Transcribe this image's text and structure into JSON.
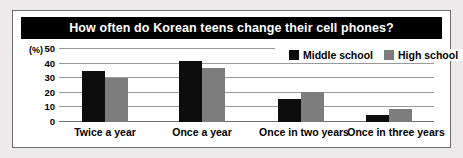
{
  "title": "How often do Korean teens change their cell phones?",
  "y_unit": "(%)",
  "legend": {
    "items": [
      {
        "label": "Middle school",
        "color": "#0d0d0d",
        "swatch": "black-square-icon"
      },
      {
        "label": "High school",
        "color": "#7d7d7d",
        "swatch": "gray-square-icon"
      }
    ]
  },
  "chart_data": {
    "type": "bar",
    "title": "How often do Korean teens change their cell phones?",
    "xlabel": "",
    "ylabel": "(%)",
    "ylim": [
      0,
      50
    ],
    "yticks": [
      0,
      10,
      20,
      30,
      40,
      50
    ],
    "ytick_labels": [
      "0",
      "10",
      "20",
      "30",
      "40",
      "50"
    ],
    "grid": true,
    "legend_position": "top-right",
    "categories": [
      "Twice a year",
      "Once a year",
      "Once in two years",
      "Once in three years"
    ],
    "series": [
      {
        "name": "Middle school",
        "color": "#0d0d0d",
        "values": [
          35,
          42,
          15.5,
          5
        ]
      },
      {
        "name": "High school",
        "color": "#7d7d7d",
        "values": [
          30,
          37,
          20.5,
          9
        ]
      }
    ]
  }
}
